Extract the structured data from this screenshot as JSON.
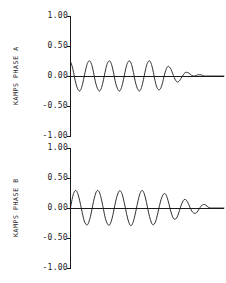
{
  "figure": {
    "background_color": "#ffffff",
    "ink_color": "#1a1a1a",
    "width": 226,
    "height": 283
  },
  "chart_data": [
    {
      "type": "line",
      "title": "",
      "panel_id": "phase-a",
      "ylabel": "KAMPS  PHASE A",
      "xlabel": "",
      "ylim": [
        -1.0,
        1.0
      ],
      "yticks": [
        1.0,
        0.5,
        0.0,
        -0.5,
        -1.0
      ],
      "ytick_labels": [
        "1.00",
        "0.50",
        "0.00",
        "-0.50",
        "-1.00"
      ],
      "xlim": [
        0,
        100
      ],
      "xticks": [],
      "xtick_labels": [],
      "grid": false,
      "legend": null,
      "baseline_y": 0.0,
      "description": "Damped sinusoid, starts at positive offset, near-constant amplitude for about five cycles then rapid decay to zero.",
      "series": [
        {
          "name": "phase-a-waveform",
          "color": "#1a1a1a",
          "x": [
            0,
            1,
            2,
            3,
            4,
            5,
            6,
            7,
            8,
            9,
            10,
            11,
            12,
            13,
            14,
            15,
            16,
            17,
            18,
            19,
            20,
            21,
            22,
            23,
            24,
            25,
            26,
            27,
            28,
            29,
            30,
            31,
            32,
            33,
            34,
            35,
            36,
            37,
            38,
            39,
            40,
            41,
            42,
            43,
            44,
            45,
            46,
            47,
            48,
            49,
            50,
            51,
            52,
            53,
            54,
            55,
            56,
            57,
            58,
            59,
            60,
            61,
            62,
            63,
            64,
            65,
            66,
            67,
            68,
            69,
            70,
            71,
            72,
            73,
            74,
            75,
            76,
            77,
            78,
            79,
            80,
            81,
            82,
            83,
            84,
            85,
            86,
            87,
            88,
            89,
            90,
            91,
            92,
            93,
            94,
            95,
            96,
            97,
            98,
            99,
            100
          ],
          "y": [
            0.24,
            0.17,
            0.06,
            -0.07,
            -0.17,
            -0.23,
            -0.25,
            -0.21,
            -0.12,
            0.0,
            0.12,
            0.21,
            0.25,
            0.24,
            0.17,
            0.06,
            -0.07,
            -0.17,
            -0.23,
            -0.25,
            -0.21,
            -0.12,
            0.0,
            0.12,
            0.21,
            0.25,
            0.24,
            0.17,
            0.06,
            -0.07,
            -0.17,
            -0.23,
            -0.25,
            -0.21,
            -0.12,
            0.0,
            0.12,
            0.21,
            0.25,
            0.24,
            0.17,
            0.06,
            -0.07,
            -0.17,
            -0.23,
            -0.25,
            -0.21,
            -0.12,
            0.0,
            0.12,
            0.21,
            0.25,
            0.24,
            0.17,
            0.06,
            -0.07,
            -0.17,
            -0.22,
            -0.23,
            -0.19,
            -0.11,
            0.0,
            0.09,
            0.15,
            0.16,
            0.13,
            0.08,
            0.01,
            -0.05,
            -0.09,
            -0.1,
            -0.08,
            -0.04,
            0.0,
            0.04,
            0.06,
            0.06,
            0.05,
            0.03,
            0.01,
            0.0,
            0.0,
            0.01,
            0.02,
            0.02,
            0.02,
            0.01,
            0.0,
            0.0,
            0.0,
            0.0,
            0.0,
            0.0,
            0.0,
            0.0,
            0.0,
            0.0,
            0.0,
            0.0,
            0.0,
            0.0
          ]
        }
      ]
    },
    {
      "type": "line",
      "title": "",
      "panel_id": "phase-b",
      "ylabel": "KAMPS  PHASE B",
      "xlabel": "",
      "ylim": [
        -1.0,
        1.0
      ],
      "yticks": [
        1.0,
        0.5,
        0.0,
        -0.5,
        -1.0
      ],
      "ytick_labels": [
        "1.00",
        "0.50",
        "0.00",
        "-0.50",
        "-1.00"
      ],
      "xlim": [
        0,
        100
      ],
      "xticks": [],
      "xtick_labels": [],
      "grid": false,
      "legend": null,
      "baseline_y": 0.0,
      "description": "Damped sinusoid starting from zero, rising to about +0.30, about six cycles of near-constant amplitude then gradual ringing decay to zero.",
      "series": [
        {
          "name": "phase-b-waveform",
          "color": "#1a1a1a",
          "x": [
            0,
            1,
            2,
            3,
            4,
            5,
            6,
            7,
            8,
            9,
            10,
            11,
            12,
            13,
            14,
            15,
            16,
            17,
            18,
            19,
            20,
            21,
            22,
            23,
            24,
            25,
            26,
            27,
            28,
            29,
            30,
            31,
            32,
            33,
            34,
            35,
            36,
            37,
            38,
            39,
            40,
            41,
            42,
            43,
            44,
            45,
            46,
            47,
            48,
            49,
            50,
            51,
            52,
            53,
            54,
            55,
            56,
            57,
            58,
            59,
            60,
            61,
            62,
            63,
            64,
            65,
            66,
            67,
            68,
            69,
            70,
            71,
            72,
            73,
            74,
            75,
            76,
            77,
            78,
            79,
            80,
            81,
            82,
            83,
            84,
            85,
            86,
            87,
            88,
            89,
            90,
            91,
            92,
            93,
            94,
            95,
            96,
            97,
            98,
            99,
            100
          ],
          "y": [
            0.0,
            0.14,
            0.24,
            0.29,
            0.28,
            0.22,
            0.12,
            0.0,
            -0.12,
            -0.22,
            -0.27,
            -0.28,
            -0.23,
            -0.14,
            -0.02,
            0.11,
            0.21,
            0.28,
            0.29,
            0.25,
            0.16,
            0.04,
            -0.09,
            -0.2,
            -0.26,
            -0.29,
            -0.26,
            -0.18,
            -0.07,
            0.06,
            0.17,
            0.25,
            0.29,
            0.27,
            0.2,
            0.09,
            -0.03,
            -0.15,
            -0.24,
            -0.29,
            -0.28,
            -0.22,
            -0.12,
            0.0,
            0.12,
            0.22,
            0.28,
            0.29,
            0.24,
            0.15,
            0.03,
            -0.09,
            -0.19,
            -0.26,
            -0.28,
            -0.25,
            -0.18,
            -0.07,
            0.04,
            0.14,
            0.21,
            0.24,
            0.23,
            0.17,
            0.08,
            -0.02,
            -0.11,
            -0.17,
            -0.19,
            -0.17,
            -0.12,
            -0.04,
            0.04,
            0.1,
            0.14,
            0.14,
            0.11,
            0.06,
            0.0,
            -0.05,
            -0.08,
            -0.09,
            -0.08,
            -0.05,
            -0.01,
            0.03,
            0.05,
            0.06,
            0.05,
            0.03,
            0.01,
            0.0,
            0.0,
            0.0,
            0.0,
            0.0,
            0.0,
            0.0,
            0.0,
            0.0,
            0.0,
            0.0
          ]
        }
      ]
    }
  ]
}
